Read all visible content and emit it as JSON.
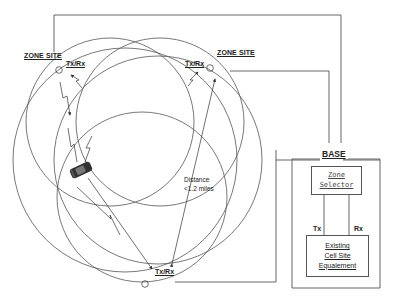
{
  "diagram": {
    "zone_sites": [
      {
        "label": "ZONE SITE",
        "antenna_label": "Tx/Rx",
        "position": "upper-left"
      },
      {
        "label": "ZONE SITE",
        "antenna_label": "Tx/Rx",
        "position": "upper-right"
      },
      {
        "label": "",
        "antenna_label": "Tx/Rx",
        "position": "bottom"
      }
    ],
    "distance_label": {
      "line1": "Distance",
      "line2": "<1.2 miles"
    },
    "base": {
      "title": "BASE",
      "zone_selector": {
        "line1": "Zone",
        "line2": "Selector"
      },
      "link_labels": {
        "tx": "Tx",
        "rx": "Rx"
      },
      "equipment": {
        "line1": "Existing",
        "line2": "Cell Site",
        "line3": "Equalement"
      }
    },
    "colors": {
      "line": "#444444",
      "background": "#ffffff",
      "text": "#222222"
    }
  }
}
